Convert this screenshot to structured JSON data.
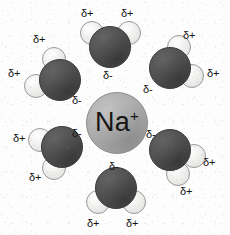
{
  "figure": {
    "background_color": "#fdfdfd"
  },
  "ion": {
    "name": "sodium-ion",
    "symbol": "Na",
    "charge_sign": "+",
    "color": "#a9a9a9",
    "center": [
      117,
      123
    ],
    "radius": 31
  },
  "palette": {
    "oxygen": "#4c4c4c",
    "hydrogen": "#f2f2f0",
    "ion": "#a9a9a9",
    "text": "#131313"
  },
  "labels": {
    "delta_positive": "δ+",
    "delta_negative": "δ-"
  },
  "molecules": [
    {
      "name": "water-top",
      "position": "top",
      "oxygen": {
        "cx": 110,
        "cy": 47,
        "r": 21
      },
      "hydrogens": [
        {
          "cx": 92,
          "cy": 33,
          "r": 12
        },
        {
          "cx": 129,
          "cy": 33,
          "r": 12
        }
      ],
      "charges": [
        {
          "text": "δ+",
          "x": 81,
          "y": 8
        },
        {
          "text": "δ+",
          "x": 121,
          "y": 8
        },
        {
          "text": "δ-",
          "x": 103,
          "y": 70
        }
      ]
    },
    {
      "name": "water-top-left",
      "position": "top-left",
      "oxygen": {
        "cx": 60,
        "cy": 80,
        "r": 21
      },
      "hydrogens": [
        {
          "cx": 54,
          "cy": 59,
          "r": 12
        },
        {
          "cx": 36,
          "cy": 86,
          "r": 12
        }
      ],
      "charges": [
        {
          "text": "δ+",
          "x": 33,
          "y": 34
        },
        {
          "text": "δ+",
          "x": 8,
          "y": 68
        },
        {
          "text": "δ-",
          "x": 72,
          "y": 95
        }
      ]
    },
    {
      "name": "water-top-right",
      "position": "top-right",
      "oxygen": {
        "cx": 170,
        "cy": 68,
        "r": 21
      },
      "hydrogens": [
        {
          "cx": 179,
          "cy": 47,
          "r": 12
        },
        {
          "cx": 192,
          "cy": 76,
          "r": 12
        }
      ],
      "charges": [
        {
          "text": "δ+",
          "x": 183,
          "y": 30
        },
        {
          "text": "δ+",
          "x": 207,
          "y": 68
        },
        {
          "text": "δ-",
          "x": 143,
          "y": 84
        }
      ]
    },
    {
      "name": "water-bottom-left",
      "position": "bottom-left",
      "oxygen": {
        "cx": 62,
        "cy": 147,
        "r": 21
      },
      "hydrogens": [
        {
          "cx": 40,
          "cy": 140,
          "r": 12
        },
        {
          "cx": 54,
          "cy": 168,
          "r": 12
        }
      ],
      "charges": [
        {
          "text": "δ+",
          "x": 13,
          "y": 133
        },
        {
          "text": "δ+",
          "x": 29,
          "y": 172
        },
        {
          "text": "δ-",
          "x": 72,
          "y": 128
        }
      ]
    },
    {
      "name": "water-bottom-right",
      "position": "bottom-right",
      "oxygen": {
        "cx": 170,
        "cy": 150,
        "r": 21
      },
      "hydrogens": [
        {
          "cx": 194,
          "cy": 156,
          "r": 12
        },
        {
          "cx": 178,
          "cy": 174,
          "r": 12
        }
      ],
      "charges": [
        {
          "text": "δ-",
          "x": 146,
          "y": 129
        },
        {
          "text": "δ+",
          "x": 203,
          "y": 157
        },
        {
          "text": "δ+",
          "x": 180,
          "y": 186
        }
      ]
    },
    {
      "name": "water-bottom",
      "position": "bottom",
      "oxygen": {
        "cx": 116,
        "cy": 188,
        "r": 21
      },
      "hydrogens": [
        {
          "cx": 98,
          "cy": 202,
          "r": 12
        },
        {
          "cx": 134,
          "cy": 202,
          "r": 12
        }
      ],
      "charges": [
        {
          "text": "δ-",
          "x": 109,
          "y": 161
        },
        {
          "text": "δ+",
          "x": 87,
          "y": 218
        },
        {
          "text": "δ+",
          "x": 126,
          "y": 218
        }
      ]
    }
  ]
}
